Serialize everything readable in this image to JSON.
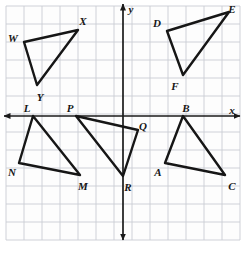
{
  "figure": {
    "grid": {
      "cell_px": 18.0,
      "origin_px": {
        "x": 123,
        "y": 116
      },
      "left_px": 6,
      "top_px": 6,
      "right_px": 240,
      "bottom_px": 240,
      "grid_color": "#c9ccd4",
      "grid_bg": "#fdfdfd",
      "columns": 13,
      "rows": 13,
      "visible_tick_numbers": []
    },
    "axes": {
      "color": "#1a1a1a",
      "x_axis": {
        "label": "x",
        "label_pos_px": {
          "x": 232,
          "y": 110
        },
        "y_px": 116,
        "x_start_px": 4,
        "x_end_px": 240,
        "arrow_left": true,
        "arrow_right": true
      },
      "y_axis": {
        "label": "y",
        "label_pos_px": {
          "x": 131,
          "y": 9
        },
        "x_px": 123,
        "y_start_px": 4,
        "y_end_px": 240,
        "arrow_up": true,
        "arrow_down": true
      }
    },
    "stroke": {
      "color": "#161616",
      "width_px": 2.4
    },
    "triangles": [
      {
        "name": "WXY",
        "quadrant": "II",
        "vertices": [
          {
            "label": "W",
            "px": {
              "x": 24,
              "y": 42
            },
            "label_px": {
              "x": 13,
              "y": 38
            },
            "grid": {
              "x": -5.5,
              "y": 4.1
            }
          },
          {
            "label": "X",
            "px": {
              "x": 78,
              "y": 30
            },
            "label_px": {
              "x": 83,
              "y": 21
            },
            "grid": {
              "x": -2.5,
              "y": 4.8
            }
          },
          {
            "label": "Y",
            "px": {
              "x": 37,
              "y": 85
            },
            "label_px": {
              "x": 40,
              "y": 97
            },
            "grid": {
              "x": -4.8,
              "y": 1.7
            }
          }
        ]
      },
      {
        "name": "DEF",
        "quadrant": "I",
        "vertices": [
          {
            "label": "D",
            "px": {
              "x": 167,
              "y": 31
            },
            "label_px": {
              "x": 157,
              "y": 23
            },
            "grid": {
              "x": 2.4,
              "y": 4.7
            }
          },
          {
            "label": "E",
            "px": {
              "x": 229,
              "y": 12
            },
            "label_px": {
              "x": 232,
              "y": 9
            },
            "grid": {
              "x": 5.9,
              "y": 5.8
            }
          },
          {
            "label": "F",
            "px": {
              "x": 183,
              "y": 75
            },
            "label_px": {
              "x": 175,
              "y": 86
            },
            "grid": {
              "x": 3.3,
              "y": 2.3
            }
          }
        ]
      },
      {
        "name": "LMN",
        "quadrant": "III",
        "vertices": [
          {
            "label": "L",
            "px": {
              "x": 33,
              "y": 116
            },
            "label_px": {
              "x": 27,
              "y": 108
            },
            "grid": {
              "x": -5.0,
              "y": 0
            }
          },
          {
            "label": "M",
            "px": {
              "x": 80,
              "y": 175
            },
            "label_px": {
              "x": 83,
              "y": 186
            },
            "grid": {
              "x": -2.4,
              "y": -3.3
            }
          },
          {
            "label": "N",
            "px": {
              "x": 19,
              "y": 163
            },
            "label_px": {
              "x": 12,
              "y": 172
            },
            "grid": {
              "x": -5.8,
              "y": -2.6
            }
          }
        ]
      },
      {
        "name": "PQR",
        "quadrant": "III-IV",
        "vertices": [
          {
            "label": "P",
            "px": {
              "x": 76,
              "y": 116
            },
            "label_px": {
              "x": 70,
              "y": 108
            },
            "grid": {
              "x": -2.6,
              "y": 0
            }
          },
          {
            "label": "Q",
            "px": {
              "x": 138,
              "y": 130
            },
            "label_px": {
              "x": 143,
              "y": 126
            },
            "grid": {
              "x": 0.8,
              "y": -0.8
            }
          },
          {
            "label": "R",
            "px": {
              "x": 123,
              "y": 176
            },
            "label_px": {
              "x": 128,
              "y": 187
            },
            "grid": {
              "x": 0,
              "y": -3.3
            }
          }
        ]
      },
      {
        "name": "ABC",
        "quadrant": "IV",
        "vertices": [
          {
            "label": "A",
            "px": {
              "x": 165,
              "y": 163
            },
            "label_px": {
              "x": 158,
              "y": 172
            },
            "grid": {
              "x": 2.3,
              "y": -2.6
            }
          },
          {
            "label": "B",
            "px": {
              "x": 183,
              "y": 116
            },
            "label_px": {
              "x": 186,
              "y": 108
            },
            "grid": {
              "x": 3.3,
              "y": 0
            }
          },
          {
            "label": "C",
            "px": {
              "x": 225,
              "y": 175
            },
            "label_px": {
              "x": 232,
              "y": 186
            },
            "grid": {
              "x": 5.7,
              "y": -3.3
            }
          }
        ]
      }
    ]
  }
}
